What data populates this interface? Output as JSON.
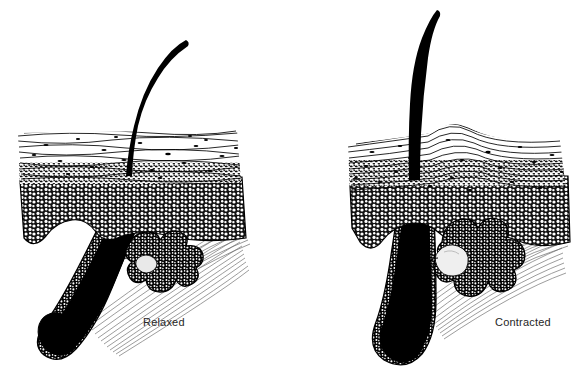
{
  "figure": {
    "background_color": "#ffffff",
    "ink_color": "#000000",
    "label_color": "#262626",
    "width": 580,
    "height": 373
  },
  "panels": [
    {
      "id": "panel-relaxed",
      "label": "Relaxed",
      "label_x": 143,
      "label_y": 326,
      "hair_state": "oblique, bent shaft emerging at a slant",
      "skin_surface": "flat",
      "structures": [
        {
          "name": "hair-shaft",
          "description": "thick black curved shaft rising up and to the right"
        },
        {
          "name": "stratum-corneum",
          "description": "wavy horizontal keratin lines with dark flecks"
        },
        {
          "name": "epidermis-granular-layer",
          "description": "dense dark stippled band"
        },
        {
          "name": "epidermis-cellular-layer",
          "description": "field of small open circles (cells)"
        },
        {
          "name": "hair-follicle",
          "description": "oblique black follicle with stippled outer root sheath"
        },
        {
          "name": "hair-bulb",
          "description": "rounded black bulb at follicle base"
        },
        {
          "name": "sebaceous-gland",
          "description": "small multi-lobed stippled gland on follicle"
        },
        {
          "name": "arrector-pili-muscle",
          "description": "slack fan of fine gray striated fibers from dermis to follicle"
        },
        {
          "name": "dermis",
          "description": "open white connective-tissue region"
        }
      ]
    },
    {
      "id": "panel-contracted",
      "label": "Contracted",
      "label_x": 495,
      "label_y": 326,
      "hair_state": "erect, near-vertical shaft",
      "skin_surface": "raised goose-bump mound at hair emergence",
      "structures": [
        {
          "name": "hair-shaft",
          "description": "thick black near-vertical shaft"
        },
        {
          "name": "stratum-corneum",
          "description": "wavy horizontal keratin lines humped over the bump"
        },
        {
          "name": "epidermis-granular-layer",
          "description": "dense dark stippled band"
        },
        {
          "name": "epidermis-cellular-layer",
          "description": "field of small open circles (cells)"
        },
        {
          "name": "hair-follicle",
          "description": "upright black follicle with stippled outer root sheath"
        },
        {
          "name": "hair-bulb",
          "description": "rounded black bulb at follicle base"
        },
        {
          "name": "sebaceous-gland",
          "description": "enlarged multi-lobed stippled gland, one pale lobe"
        },
        {
          "name": "arrector-pili-muscle",
          "description": "taut fan of fine gray striated fibers pulling follicle upright"
        },
        {
          "name": "dermis",
          "description": "open white connective-tissue region"
        }
      ]
    }
  ]
}
